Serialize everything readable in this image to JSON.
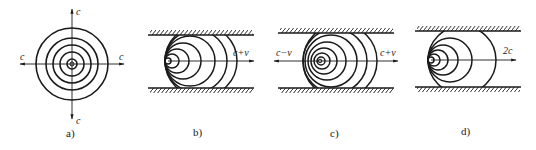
{
  "figure": {
    "panels": [
      {
        "id": "a",
        "caption": "a)",
        "description": "stationary source, concentric wavefronts",
        "labels": {
          "up": "c",
          "down": "c",
          "left": "c",
          "right": "c"
        }
      },
      {
        "id": "b",
        "caption": "b)",
        "description": "source moving in duct, wavefronts compressed toward rear",
        "labels": {
          "right": "c+v"
        }
      },
      {
        "id": "c",
        "caption": "c)",
        "description": "source in moving flow, wavefronts shifted downstream",
        "labels": {
          "left": "c−v",
          "right": "c+v"
        }
      },
      {
        "id": "d",
        "caption": "d)",
        "description": "source at sonic speed, wavefronts tangent at source",
        "labels": {
          "right": "2c"
        }
      }
    ]
  }
}
